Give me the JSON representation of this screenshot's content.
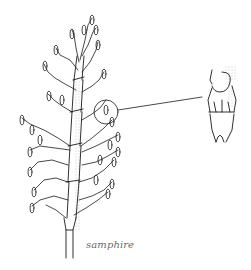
{
  "illustration": {
    "subject": "samphire plant with magnified detail of stem segment",
    "caption": "samphire",
    "colors": {
      "ink": "#1a1a1a",
      "caption": "#6a6a6a",
      "background": "#ffffff"
    }
  }
}
